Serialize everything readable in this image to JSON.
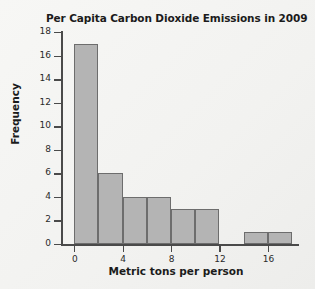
{
  "chart_data": {
    "type": "bar",
    "title": "Per Capita Carbon Dioxide Emissions in 2009",
    "xlabel": "Metric tons per person",
    "ylabel": "Frequency",
    "bin_width": 2,
    "bin_starts": [
      0,
      2,
      4,
      6,
      8,
      10,
      12,
      14,
      16
    ],
    "categories": [
      "0-2",
      "2-4",
      "4-6",
      "6-8",
      "8-10",
      "10-12",
      "12-14",
      "14-16",
      "16-18"
    ],
    "values": [
      17,
      6,
      4,
      4,
      3,
      3,
      0,
      1,
      1
    ],
    "xlim": [
      -1,
      18.5
    ],
    "ylim": [
      0,
      18
    ],
    "x_ticks": [
      0,
      4,
      8,
      12,
      16
    ],
    "x_tick_labels": [
      "0",
      "4",
      "8",
      "12",
      "16"
    ],
    "y_ticks": [
      0,
      2,
      4,
      6,
      8,
      10,
      12,
      14,
      16,
      18
    ],
    "y_tick_labels": [
      "0",
      "2",
      "4",
      "6",
      "8",
      "10",
      "12",
      "14",
      "16",
      "18"
    ],
    "grid": false,
    "legend": false,
    "bar_color": "#b4b4b4",
    "bar_edge_color": "#6d6d6d",
    "axis_color": "#4a4a4a",
    "background_color": "#f4f4f2"
  }
}
